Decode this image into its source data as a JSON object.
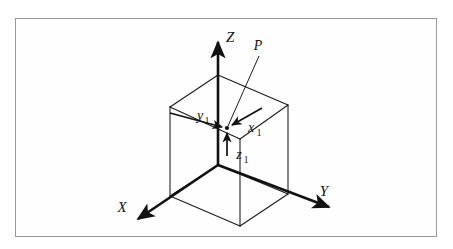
{
  "figure": {
    "background_color": "#ffffff",
    "frame_color": "#9a9a9a",
    "line_color": "#111111",
    "cube_line_color": "#1a1a1a",
    "axes": [
      {
        "name": "x-axis",
        "label": "X",
        "label_x": 122,
        "label_y": 212,
        "direction": "down-left"
      },
      {
        "name": "y-axis",
        "label": "Y",
        "label_x": 324,
        "label_y": 196,
        "direction": "down-right"
      },
      {
        "name": "z-axis",
        "label": "Z",
        "label_x": 226,
        "label_y": 42,
        "direction": "up"
      }
    ],
    "point": {
      "name": "P",
      "label": "P",
      "label_x": 258,
      "label_y": 50,
      "marker_x": 227,
      "marker_y": 128
    },
    "components": [
      {
        "name": "x-component",
        "base": "x",
        "subscript": "1",
        "label_x": 252,
        "label_y": 132
      },
      {
        "name": "y-component",
        "base": "y",
        "subscript": "1",
        "label_x": 202,
        "label_y": 120
      },
      {
        "name": "z-component",
        "base": "z",
        "subscript": "1",
        "label_x": 240,
        "label_y": 159
      }
    ],
    "origin": {
      "x": 218,
      "y": 165
    },
    "cube": {
      "description": "wireframe rectangular box showing projection of point P",
      "vertices": {
        "top_back": [
          218,
          75
        ],
        "top_left": [
          170,
          107
        ],
        "top_right": [
          288,
          105
        ],
        "top_front": [
          240,
          139
        ],
        "bottom_back": [
          218,
          165
        ],
        "bottom_left": [
          170,
          196
        ],
        "bottom_right": [
          288,
          194
        ],
        "bottom_front": [
          240,
          226
        ]
      }
    }
  }
}
